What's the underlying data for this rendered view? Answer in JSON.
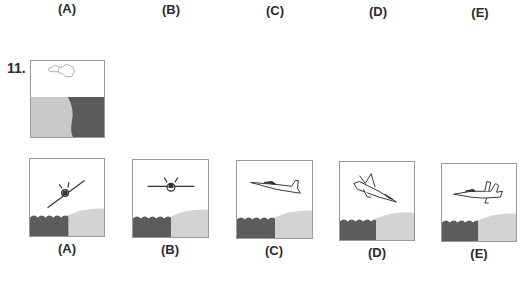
{
  "top_option_labels": [
    "(A)",
    "(B)",
    "(C)",
    "(D)",
    "(E)"
  ],
  "question": {
    "number": "11.",
    "prompt_image": {
      "description": "Sky with two small clouds above; lower half split into light gray sand (left) and dark gray water (right)",
      "elements": [
        "cloud-icon",
        "cloud-icon",
        "sand-region",
        "water-region"
      ]
    }
  },
  "options": [
    {
      "label": "(A)",
      "aircraft_view": "front view, banked steeply",
      "scene": "dark water with waves on left, light gray beach on right"
    },
    {
      "label": "(B)",
      "aircraft_view": "front view, level wings",
      "scene": "dark water with waves on left, light gray beach on right"
    },
    {
      "label": "(C)",
      "aircraft_view": "side view, nose left, climbing",
      "scene": "dark water with waves on left, light gray beach on right"
    },
    {
      "label": "(D)",
      "aircraft_view": "side view, nose down-right, diving",
      "scene": "dark water with waves on left, light gray beach on right"
    },
    {
      "label": "(E)",
      "aircraft_view": "side view, nose left, level",
      "scene": "dark water with waves on left, light gray beach on right"
    }
  ],
  "colors": {
    "water": "#5f5f5f",
    "sand": "#c8c8c8",
    "sand_light": "#d6d6d6",
    "border": "#9a9a9a",
    "text": "#2b2b2b"
  }
}
